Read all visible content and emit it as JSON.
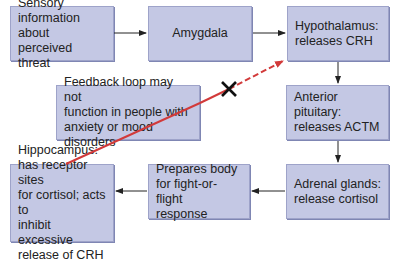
{
  "diagram": {
    "nodes": [
      {
        "id": "sensory",
        "label": "Sensory\ninformation about\nperceived  threat"
      },
      {
        "id": "amygdala",
        "label": "Amygdala"
      },
      {
        "id": "hypothalamus",
        "label": "Hypothalamus:\nreleases CRH"
      },
      {
        "id": "pituitary",
        "label": "Anterior pituitary:\nreleases ACTM"
      },
      {
        "id": "adrenal",
        "label": "Adrenal glands:\nrelease cortisol"
      },
      {
        "id": "prepares",
        "label": "Prepares body\nfor fight-or-flight\nresponse"
      },
      {
        "id": "hippocampus",
        "label": "Hippocampus:\nhas receptor sites\nfor cortisol; acts to\ninhibit excessive\nrelease of CRH"
      },
      {
        "id": "feedback",
        "label": "Feedback loop may not\nfunction in people with\nanxiety or mood disorders"
      }
    ],
    "edges": [
      {
        "from": "sensory",
        "to": "amygdala",
        "style": "solid-black-arrow"
      },
      {
        "from": "amygdala",
        "to": "hypothalamus",
        "style": "solid-black-arrow"
      },
      {
        "from": "hypothalamus",
        "to": "pituitary",
        "style": "solid-black-arrow"
      },
      {
        "from": "pituitary",
        "to": "adrenal",
        "style": "solid-black-arrow"
      },
      {
        "from": "adrenal",
        "to": "prepares",
        "style": "solid-black-arrow"
      },
      {
        "from": "prepares",
        "to": "hippocampus",
        "style": "solid-black-arrow"
      },
      {
        "from": "hippocampus",
        "to": "hypothalamus",
        "style": "red-line-then-dashed-arrow",
        "blocked_marker": "x-mark"
      }
    ],
    "colors": {
      "box_fill": "#c4c8e4",
      "box_border": "#9ea3c9",
      "arrow": "#222222",
      "feedback_line": "#d23a3a",
      "x_mark": "#111111"
    }
  }
}
